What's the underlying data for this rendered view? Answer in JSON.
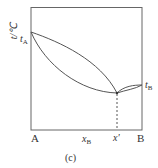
{
  "diagram": {
    "caption": "(c)",
    "y_axis_label": "t/℃",
    "left_component": "A",
    "right_component": "B",
    "left_point": {
      "symbol": "t",
      "subscript": "A"
    },
    "right_point": {
      "symbol": "t",
      "subscript": "B"
    },
    "x_label_1": {
      "symbol": "x",
      "subscript": "B"
    },
    "x_label_2": "x'",
    "line_color": "#555555"
  }
}
